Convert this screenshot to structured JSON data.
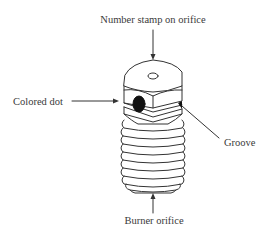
{
  "diagram": {
    "title_fragment": "",
    "labels": {
      "top": "Number stamp on orifice",
      "left": "Colored dot",
      "right": "Groove",
      "bottom": "Burner orifice"
    },
    "colors": {
      "line": "#333333",
      "dot_fill": "#111111",
      "text": "#3a3a3a",
      "background": "#ffffff"
    }
  }
}
